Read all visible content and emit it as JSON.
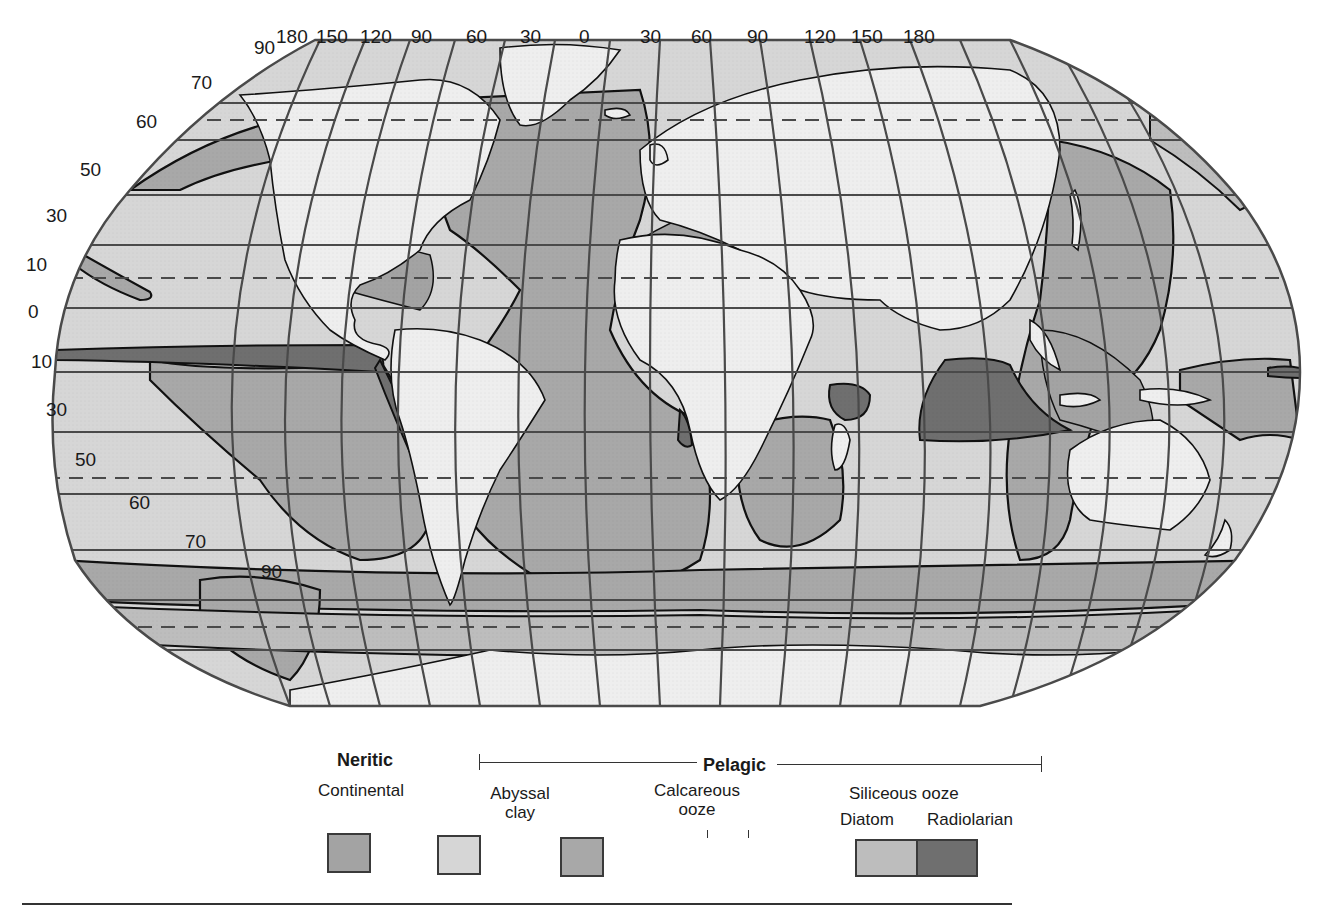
{
  "map": {
    "title": "Distribution of ocean floor sediments",
    "longitude_labels": [
      "180",
      "150",
      "120",
      "90",
      "60",
      "30",
      "0",
      "30",
      "60",
      "90",
      "120",
      "150",
      "180"
    ],
    "latitude_labels_north": [
      "90",
      "70",
      "60",
      "50",
      "30",
      "10"
    ],
    "latitude_equator": "0",
    "latitude_labels_south": [
      "10",
      "30",
      "50",
      "60",
      "70",
      "90"
    ],
    "colors": {
      "land": "#eeeeee",
      "neritic_continental": "#a3a3a3",
      "abyssal_clay": "#d6d6d6",
      "calcareous_ooze": "#a8a8a8",
      "siliceous_diatom": "#bdbdbd",
      "siliceous_radiolarian": "#6f6f6f",
      "grid": "#4a4a4a",
      "outline": "#111111"
    }
  },
  "legend": {
    "neritic": {
      "heading": "Neritic",
      "items": [
        {
          "label": "Continental",
          "color": "#a3a3a3"
        }
      ]
    },
    "pelagic": {
      "heading": "Pelagic",
      "items": [
        {
          "label_line1": "Abyssal",
          "label_line2": "clay",
          "color": "#d6d6d6"
        },
        {
          "label_line1": "Calcareous",
          "label_line2": "ooze",
          "color": "#a8a8a8"
        }
      ],
      "siliceous": {
        "label": "Siliceous ooze",
        "diatom": {
          "label": "Diatom",
          "color": "#bdbdbd"
        },
        "radiolarian": {
          "label": "Radiolarian",
          "color": "#6f6f6f"
        }
      }
    }
  }
}
